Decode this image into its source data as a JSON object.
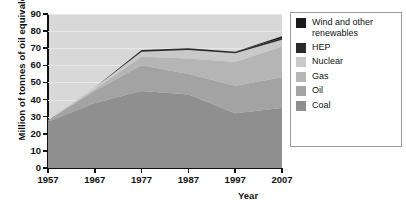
{
  "chart_data": {
    "type": "area",
    "title": "",
    "xlabel": "Year",
    "ylabel": "Million of tonnes of oil equivalent",
    "x": [
      1957,
      1967,
      1977,
      1987,
      1997,
      2007
    ],
    "xticks": [
      "1957",
      "1967",
      "1977",
      "1987",
      "1997",
      "2007"
    ],
    "yticks": [
      "0",
      "10",
      "20",
      "30",
      "40",
      "50",
      "60",
      "70",
      "80",
      "90"
    ],
    "xlim": [
      1957,
      2007
    ],
    "ylim": [
      0,
      90
    ],
    "grid": true,
    "stacked": true,
    "legend_position": "right",
    "series": [
      {
        "name": "Coal",
        "color": "#8f8f8f",
        "values": [
          27,
          38,
          45,
          43,
          32,
          35
        ]
      },
      {
        "name": "Oil",
        "color": "#a3a3a3",
        "values": [
          1,
          7,
          15,
          12,
          16,
          18
        ]
      },
      {
        "name": "Gas",
        "color": "#b5b5b5",
        "values": [
          0,
          1,
          5,
          9,
          14,
          18
        ]
      },
      {
        "name": "Nuclear",
        "color": "#c9c9c9",
        "values": [
          0,
          1,
          3,
          5,
          5,
          4
        ]
      },
      {
        "name": "HEP",
        "color": "#2b2b2b",
        "values": [
          0,
          0,
          1,
          1,
          1,
          1
        ]
      },
      {
        "name": "Wind and other renewables",
        "color": "#1a1a1a",
        "values": [
          0,
          0,
          0,
          0,
          0,
          1
        ]
      }
    ],
    "totals": [
      28,
      47,
      69,
      70,
      68,
      77
    ]
  },
  "axes": {
    "y_title": "Million of tonnes of oil equivalent",
    "x_title": "Year",
    "y_ticks": [
      "90",
      "80",
      "70",
      "60",
      "50",
      "40",
      "30",
      "20",
      "10",
      "0"
    ],
    "x_ticks": [
      "1957",
      "1967",
      "1977",
      "1987",
      "1997",
      "2007"
    ]
  },
  "legend": {
    "items": [
      {
        "label": "Wind and other renewables",
        "color": "#1a1a1a"
      },
      {
        "label": "HEP",
        "color": "#2b2b2b"
      },
      {
        "label": "Nuclear",
        "color": "#c9c9c9"
      },
      {
        "label": "Gas",
        "color": "#b5b5b5"
      },
      {
        "label": "Oil",
        "color": "#a3a3a3"
      },
      {
        "label": "Coal",
        "color": "#8f8f8f"
      }
    ]
  },
  "colors": {
    "plot_background": "#d8d8d8",
    "gridline": "#eceaea",
    "axis": "#111111",
    "legend_border": "#9a9a9a"
  }
}
